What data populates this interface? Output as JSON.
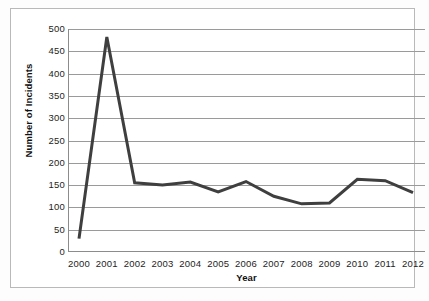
{
  "chart_data": {
    "type": "line",
    "title": "",
    "xlabel": "Year",
    "ylabel": "Number of Incidents",
    "categories": [
      "2000",
      "2001",
      "2002",
      "2003",
      "2004",
      "2005",
      "2006",
      "2007",
      "2008",
      "2009",
      "2010",
      "2011",
      "2012"
    ],
    "values": [
      30,
      482,
      155,
      150,
      157,
      135,
      158,
      125,
      108,
      110,
      163,
      160,
      133
    ],
    "series": [
      {
        "name": "Number of Incidents",
        "values": [
          30,
          482,
          155,
          150,
          157,
          135,
          158,
          125,
          108,
          110,
          163,
          160,
          133
        ]
      }
    ],
    "ylim": [
      0,
      500
    ],
    "yticks": [
      0,
      50,
      100,
      150,
      200,
      250,
      300,
      350,
      400,
      450,
      500
    ],
    "ytick_labels": [
      "0",
      "50",
      "100",
      "150",
      "200",
      "250",
      "300",
      "350",
      "400",
      "450",
      "500"
    ],
    "grid": true,
    "grid_axis": "y",
    "legend": false,
    "legend_position": "none",
    "line_color": "#3f3f3f",
    "grid_color": "#9a9a9a",
    "axis_color": "#8c8c8c",
    "background_color": "#ffffff",
    "line_width": 3
  },
  "axes": {
    "y_title": "Number of Incidents",
    "x_title": "Year"
  }
}
